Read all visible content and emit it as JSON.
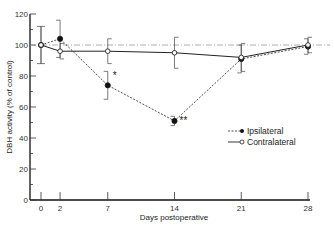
{
  "chart_data": {
    "type": "line",
    "title": "",
    "xlabel": "Days postoperative",
    "ylabel": "DBH activity (% of control)",
    "x": [
      0,
      2,
      7,
      14,
      21,
      28
    ],
    "x_ticks": [
      "0",
      "2",
      "7",
      "14",
      "21",
      "28"
    ],
    "y_ticks": [
      "0",
      "20",
      "40",
      "60",
      "80",
      "100",
      "120"
    ],
    "ylim": [
      0,
      120
    ],
    "xlim": [
      0,
      28
    ],
    "grid": false,
    "reference_line": {
      "y": 100,
      "style": "dash-dot"
    },
    "legend_position": "lower right",
    "series": [
      {
        "name": "Ipsilateral",
        "style": "dashed",
        "marker": "filled-circle",
        "values": [
          100,
          104,
          74,
          51,
          91,
          99
        ],
        "errors": [
          12,
          12,
          9,
          3,
          9,
          5
        ]
      },
      {
        "name": "Contralateral",
        "style": "solid",
        "marker": "open-circle",
        "values": [
          100,
          96,
          96,
          95,
          92,
          100
        ],
        "errors": [
          12,
          5,
          8,
          10,
          9,
          5
        ]
      }
    ],
    "annotations": [
      {
        "x": 7,
        "series": "Ipsilateral",
        "text": "*"
      },
      {
        "x": 14,
        "series": "Ipsilateral",
        "text": "**"
      }
    ]
  },
  "legend": {
    "ipsilateral": "Ipsilateral",
    "contralateral": "Contralateral"
  }
}
